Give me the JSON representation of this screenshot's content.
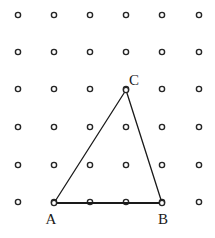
{
  "figure": {
    "canvas": {
      "width": 215,
      "height": 238,
      "background": "#ffffff"
    },
    "grid": {
      "name": "square-dot-lattice",
      "columns": 6,
      "rows": 6,
      "x_positions": [
        18,
        54,
        90,
        126,
        162,
        199
      ],
      "y_positions": [
        15,
        52,
        89,
        127,
        165,
        202
      ],
      "dot": {
        "outer_radius": 2.6,
        "inner_radius": 1.0,
        "stroke_color": "#262626",
        "fill_color": "#ffffff",
        "stroke_width": 1.4
      }
    },
    "shape": {
      "type": "triangle",
      "name": "triangle-ABC",
      "stroke_color": "#1a1a1a",
      "vertices": [
        {
          "id": "A",
          "label": "A",
          "x": 54,
          "y": 203,
          "grid_col": 2,
          "grid_row": 6,
          "label_x": 51,
          "label_y": 224,
          "label_anchor": "middle"
        },
        {
          "id": "B",
          "label": "B",
          "x": 162,
          "y": 203,
          "grid_col": 5,
          "grid_row": 6,
          "label_x": 163,
          "label_y": 224,
          "label_anchor": "middle"
        },
        {
          "id": "C",
          "label": "C",
          "x": 126,
          "y": 90,
          "grid_col": 4,
          "grid_row": 3,
          "label_x": 134,
          "label_y": 85,
          "label_anchor": "middle"
        }
      ],
      "edges": [
        {
          "id": "AB",
          "name": "base-segment-AB",
          "from": "A",
          "to": "B",
          "x1": 54,
          "y1": 203,
          "x2": 162,
          "y2": 203,
          "stroke_width": 2.1
        },
        {
          "id": "AC",
          "name": "side-segment-AC",
          "from": "A",
          "to": "C",
          "x1": 54,
          "y1": 203,
          "x2": 126,
          "y2": 90,
          "stroke_width": 1.3
        },
        {
          "id": "BC",
          "name": "side-segment-BC",
          "from": "B",
          "to": "C",
          "x1": 162,
          "y1": 203,
          "x2": 126,
          "y2": 90,
          "stroke_width": 1.3
        }
      ]
    }
  }
}
